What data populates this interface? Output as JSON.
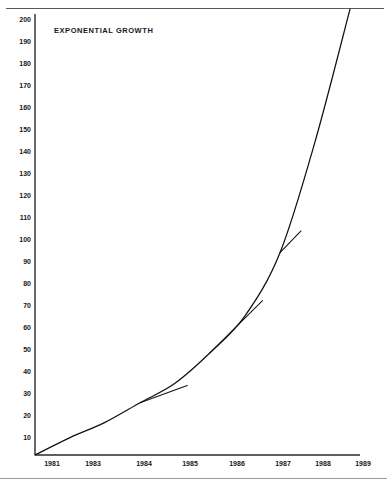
{
  "chart_data": {
    "type": "line",
    "title": "EXPONENTIAL GROWTH",
    "xlabel": "",
    "ylabel": "",
    "grid": false,
    "legend": "none",
    "x": [
      1981,
      1982,
      1983,
      1984,
      1985,
      1986,
      1987,
      1988,
      1989,
      1990
    ],
    "xlim": [
      1981,
      1990.2
    ],
    "ylim": [
      0,
      200
    ],
    "x_tick_labels": [
      "1981",
      "1983",
      "1984",
      "1985",
      "1986",
      "1987",
      "1988",
      "1989"
    ],
    "x_tick_values": [
      1981,
      1983,
      1984,
      1985,
      1986,
      1987,
      1988,
      1989
    ],
    "y_tick_labels": [
      "200",
      "190",
      "180",
      "170",
      "160",
      "150",
      "140",
      "130",
      "120",
      "110",
      "100",
      "90",
      "80",
      "70",
      "60",
      "50",
      "40",
      "30",
      "20",
      "10"
    ],
    "y_tick_values": [
      200,
      190,
      180,
      170,
      160,
      150,
      140,
      130,
      120,
      110,
      100,
      90,
      80,
      70,
      60,
      50,
      40,
      30,
      20,
      10
    ],
    "series": [
      {
        "name": "exponential curve",
        "values": [
          0,
          8,
          15,
          24,
          33,
          47,
          64,
          93,
          144,
          205
        ],
        "color": "#111111"
      }
    ],
    "annotations": [
      {
        "name": "tangent-1984",
        "type": "tangent-line",
        "touch_point": {
          "x": 1984,
          "y": 24
        },
        "end_point": {
          "x": 1985.35,
          "y": 32
        },
        "color": "#111111"
      },
      {
        "name": "tangent-1986",
        "type": "tangent-line",
        "touch_point": {
          "x": 1986,
          "y": 47
        },
        "end_point": {
          "x": 1987.5,
          "y": 71
        },
        "color": "#111111"
      },
      {
        "name": "tangent-1988",
        "type": "tangent-line",
        "touch_point": {
          "x": 1988,
          "y": 93
        },
        "end_point": {
          "x": 1988.6,
          "y": 103
        },
        "color": "#111111"
      }
    ],
    "axis_color": "#222222",
    "frame_color": "#5a5a5a",
    "background": "#ffffff"
  },
  "chart": {
    "title": "EXPONENTIAL GROWTH"
  },
  "y_ticks": [
    {
      "label": "200",
      "top": 16
    },
    {
      "label": "190",
      "top": 38
    },
    {
      "label": "180",
      "top": 60
    },
    {
      "label": "170",
      "top": 82
    },
    {
      "label": "160",
      "top": 104
    },
    {
      "label": "150",
      "top": 126
    },
    {
      "label": "140",
      "top": 148
    },
    {
      "label": "130",
      "top": 170
    },
    {
      "label": "120",
      "top": 192
    },
    {
      "label": "110",
      "top": 214
    },
    {
      "label": "100",
      "top": 236
    },
    {
      "label": "90",
      "top": 258
    },
    {
      "label": "80",
      "top": 280
    },
    {
      "label": "70",
      "top": 302
    },
    {
      "label": "60",
      "top": 324
    },
    {
      "label": "50",
      "top": 346
    },
    {
      "label": "40",
      "top": 368
    },
    {
      "label": "30",
      "top": 390
    },
    {
      "label": "20",
      "top": 412
    },
    {
      "label": "10",
      "top": 434
    }
  ],
  "x_ticks": [
    {
      "label": "1981",
      "left": 52
    },
    {
      "label": "1983",
      "left": 93
    },
    {
      "label": "1984",
      "left": 144
    },
    {
      "label": "1985",
      "left": 190
    },
    {
      "label": "1986",
      "left": 237
    },
    {
      "label": "1987",
      "left": 283
    },
    {
      "label": "1988",
      "left": 323
    },
    {
      "label": "1989",
      "left": 363
    }
  ]
}
